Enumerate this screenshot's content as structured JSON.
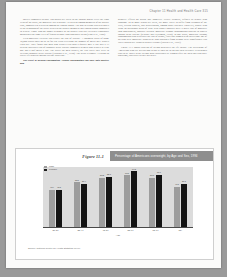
{
  "running_head": "Chapter 11   Health and Health Care   315",
  "left_column": [
    "society compared to only 150 nurses per week in the control group. Over the eight years of the study, the mortality rate was only 1.5 percent among members of the nurses' club, compared to 5 percent among the control group. The gap in deaths was best noted at the beginning of the study between the nurses' members and control group compared to widest. Those who no longer belonged to the nurses' club but exercised vigorously maintained the same level of fitness as those who continued to run (Paro et al., 1986).",
    "Even moderate exercise can reduce the risk of disease. A landmark study of some 10,000 adults aged 25 to 95 for ten years revealing the number of miles they walked each day. They found that men who walked less than a quarter mile a day had a 33 percent increased risk of coronary heart disease compared to men who walked at least one and a half miles a day. The better the men walked, the less likely they were to develop coronary heart disease (Haskins et al., 1990). The news is simple. Leading an active life protects against decline in old age.",
    "The effect of alcohol consumption   Alcohol consumption can have both positive and"
  ],
  "right_column": [
    "negative effects on health and longevity. Heavy drinkers, defined as people who consume 14 or more drinks per week, are more likely to suffer from cirrhosis of the liver, certain cancers, and hypertension, among other diseases. However, people who drink an occasional glass of wine with dinner possibly have a lower risk of mortality than nondrinkers, possibly because moderate alcohol consumption appears to protect against heart disease (Klatsky and Friedman, 1995). In one study, moderate alcohol consumption also decreased the risk of stroke, fiber and women with an average age of 55 who were moderate drinkers or who abstained from alcohol were significantly less likely than heavy drinkers to have a stroke (Sacco et al., 1999).",
    "Figure 11-1 shows patterns of weight gain over the life course. The percentage of Americans who are overweight peaks at ages 55 to 64 and then declines. Percentages tend to be lower in the weight gain established by women after 55. Men and also have problems, especially as they get older."
  ],
  "figure": {
    "number": "Figure 11-1",
    "title": "Percentage of Americans overweight, by Age and Sex, 1994",
    "source": "Source: National Center for Health Statistics (1996)",
    "legend": [
      {
        "label": "Male",
        "color": "#9d9d9d"
      },
      {
        "label": "Female",
        "color": "#141414"
      }
    ]
  },
  "chart_data": {
    "type": "bar",
    "title": "Percentage of Americans overweight, by Age and Sex, 1994",
    "xlabel": "Age",
    "ylabel": "",
    "ylim": [
      0,
      70
    ],
    "grid": false,
    "legend_position": "top-left",
    "categories": [
      "20-34",
      "35-44",
      "45-54",
      "55-64",
      "65-74",
      "75+"
    ],
    "series": [
      {
        "name": "Male",
        "color": "#9d9d9d",
        "values": [
          43.4,
          52.1,
          57.2,
          60.5,
          57.3,
          47.1
        ]
      },
      {
        "name": "Female",
        "color": "#141414",
        "values": [
          43.5,
          50.4,
          58.3,
          64.8,
          60.6,
          50.1
        ]
      }
    ]
  }
}
